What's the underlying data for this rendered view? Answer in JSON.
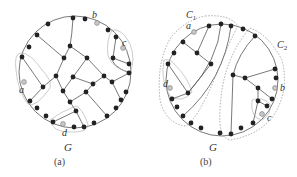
{
  "figure": {
    "panel_a": {
      "graph_label": "G",
      "caption": "(a)",
      "terminals": {
        "a": "a",
        "b": "b",
        "c": "c",
        "d": "d"
      }
    },
    "panel_b": {
      "graph_label": "G",
      "caption": "(b)",
      "terminals": {
        "a": "a",
        "b": "b",
        "c": "c",
        "d": "d"
      },
      "components": {
        "c1": "C",
        "c1_sub": "1",
        "c2": "C",
        "c2_sub": "2"
      }
    }
  },
  "colors": {
    "node": "#222222",
    "terminal_node": "#c8c8c8",
    "edge": "#555555",
    "outline": "#777777"
  }
}
